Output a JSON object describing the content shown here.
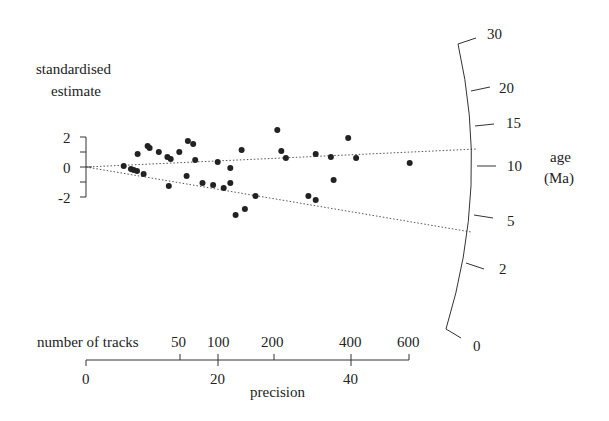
{
  "chart_data": {
    "type": "scatter",
    "subtype": "radial-plot",
    "title": "",
    "ylabel_lines": [
      "standardised",
      "estimate"
    ],
    "yticks": [
      "2",
      "0",
      "-2"
    ],
    "ylim": [
      -2,
      2
    ],
    "xlabel": "precision",
    "xticks": [
      "0",
      "20",
      "40"
    ],
    "xlim": [
      0,
      49
    ],
    "secondary_x": {
      "label": "number of tracks",
      "ticks": [
        "50",
        "100",
        "200",
        "400",
        "600"
      ]
    },
    "radial_axis": {
      "label_lines": [
        "age",
        "(Ma)"
      ],
      "ticks": [
        "30",
        "20",
        "15",
        "10",
        "5",
        "2",
        "0"
      ]
    },
    "reference_lines": [
      {
        "name": "upper",
        "age_Ma": 11.5,
        "style": "dotted"
      },
      {
        "name": "lower",
        "age_Ma": 4.2,
        "style": "dotted"
      }
    ],
    "points": [
      {
        "precision": 5.7,
        "z": 0.07
      },
      {
        "precision": 6.8,
        "z": -0.13
      },
      {
        "precision": 7.2,
        "z": -0.2
      },
      {
        "precision": 7.7,
        "z": -0.27
      },
      {
        "precision": 8.7,
        "z": -0.47
      },
      {
        "precision": 7.8,
        "z": 0.87
      },
      {
        "precision": 9.3,
        "z": 1.4
      },
      {
        "precision": 9.6,
        "z": 1.27
      },
      {
        "precision": 11.0,
        "z": 1.0
      },
      {
        "precision": 12.3,
        "z": 0.67
      },
      {
        "precision": 12.8,
        "z": 0.53
      },
      {
        "precision": 14.1,
        "z": 1.0
      },
      {
        "precision": 15.4,
        "z": 1.73
      },
      {
        "precision": 16.2,
        "z": 1.53
      },
      {
        "precision": 16.5,
        "z": 0.47
      },
      {
        "precision": 12.5,
        "z": -1.27
      },
      {
        "precision": 15.2,
        "z": -0.6
      },
      {
        "precision": 19.9,
        "z": 0.33
      },
      {
        "precision": 21.8,
        "z": -0.07
      },
      {
        "precision": 17.6,
        "z": -1.07
      },
      {
        "precision": 19.2,
        "z": -1.2
      },
      {
        "precision": 20.8,
        "z": -1.4
      },
      {
        "precision": 21.8,
        "z": -1.07
      },
      {
        "precision": 25.6,
        "z": -1.93
      },
      {
        "precision": 24.0,
        "z": -2.8
      },
      {
        "precision": 22.6,
        "z": -3.2
      },
      {
        "precision": 28.9,
        "z": 2.47
      },
      {
        "precision": 29.5,
        "z": 1.07
      },
      {
        "precision": 30.2,
        "z": 0.6
      },
      {
        "precision": 34.7,
        "z": 0.87
      },
      {
        "precision": 37.0,
        "z": 0.67
      },
      {
        "precision": 39.6,
        "z": 1.93
      },
      {
        "precision": 40.8,
        "z": 0.6
      },
      {
        "precision": 37.4,
        "z": -0.87
      },
      {
        "precision": 33.6,
        "z": -1.93
      },
      {
        "precision": 34.7,
        "z": -2.2
      },
      {
        "precision": 48.9,
        "z": 0.27
      },
      {
        "precision": 23.5,
        "z": 1.13
      }
    ]
  }
}
